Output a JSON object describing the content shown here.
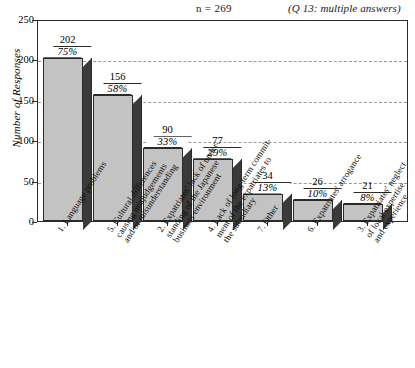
{
  "header": {
    "n_label": "n = 269",
    "question_note": "(Q 13: multiple answers)"
  },
  "axes": {
    "y_title": "Number of Responses",
    "y_ticks": [
      "0",
      "50",
      "100",
      "150",
      "200",
      "250"
    ]
  },
  "chart_data": {
    "type": "bar",
    "title": "",
    "subtitle": "",
    "xlabel": "",
    "ylabel": "Number of Responses",
    "ylim": [
      0,
      250
    ],
    "ytick_values": [
      0,
      50,
      100,
      150,
      200,
      250
    ],
    "grid": true,
    "grid_axis": "y",
    "legend": "none",
    "n": 269,
    "annotation": "(Q 13: multiple answers)",
    "n_label": "n = 269",
    "categories": [
      "1. Language problems",
      "5. Cultural differences causing misjudgements and/or misunderstanding",
      "2. Expatriates' lack of understanding of the Japanese business environment",
      "4. Lack of long-term commitment of the expatriates to the subsidiary",
      "7. Other",
      "6. Expatriates' arrogance",
      "3. Expatriates' neglect of local expertise and experience"
    ],
    "values": [
      202,
      156,
      90,
      77,
      34,
      26,
      21
    ],
    "percent_labels": [
      "75%",
      "58%",
      "33%",
      "29%",
      "13%",
      "10%",
      "8%"
    ],
    "percents": [
      75,
      58,
      33,
      29,
      13,
      10,
      8
    ],
    "series": [
      {
        "name": "Number of Responses",
        "values": [
          202,
          156,
          90,
          77,
          34,
          26,
          21
        ]
      }
    ]
  },
  "category_lines": [
    [
      "1. Language problems"
    ],
    [
      "5. Cultural differences",
      "causing misjudgements",
      "and/or misunderstanding"
    ],
    [
      "2. Expatriates' lack of under-",
      "standing of the Japanese",
      "business environment"
    ],
    [
      "4. Lack of long-term commit-",
      "ment of the expatriates to",
      "the subsidiary"
    ],
    [
      "7. Other"
    ],
    [
      "6. Expatriates' arrogance"
    ],
    [
      "3. Expatriates' neglect",
      "of local expertise",
      "and experience"
    ]
  ],
  "colors": {
    "bar_front": "#c3c3c3",
    "bar_side": "#3a3a3a",
    "bar_top": "#ffffff",
    "outline": "#2b2b2b",
    "gridline": "#9a9a9a",
    "background": "#ffffff"
  }
}
